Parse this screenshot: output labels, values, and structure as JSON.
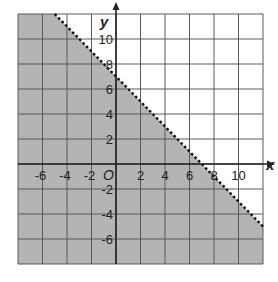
{
  "chart_data": {
    "type": "line",
    "title": "",
    "xlabel": "x",
    "ylabel": "y",
    "origin_label": "O",
    "xlim": [
      -8,
      12
    ],
    "ylim": [
      -8,
      12
    ],
    "grid": true,
    "grid_step": 2,
    "x_ticks": [
      -6,
      -4,
      -2,
      2,
      4,
      6,
      8,
      10
    ],
    "y_ticks": [
      -6,
      -4,
      -2,
      2,
      4,
      6,
      8,
      10
    ],
    "x_tick_labels": [
      "-6",
      "-4",
      "-2",
      "2",
      "4",
      "6",
      "8",
      "10"
    ],
    "y_tick_labels": [
      "-6",
      "-4",
      "-2",
      "2",
      "4",
      "6",
      "8",
      "10"
    ],
    "boundary_line": {
      "equation": "y = -x + 7",
      "slope": -1,
      "intercept": 7,
      "style": "dashed",
      "points": [
        [
          -5,
          12
        ],
        [
          12,
          -5
        ]
      ]
    },
    "shaded_region": {
      "inequality": "x + y < 7",
      "side": "below",
      "color": "#b4b4b4"
    },
    "legend": null
  },
  "colors": {
    "background": "#ffffff",
    "shade": "#b4b4b4",
    "grid": "#5a5a5a",
    "axis": "#222222",
    "boundary": "#111111"
  }
}
